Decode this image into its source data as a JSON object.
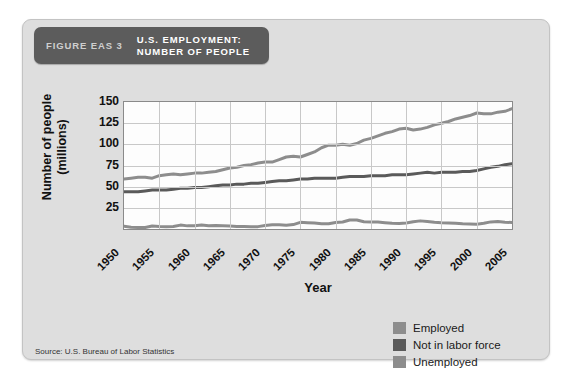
{
  "figure": {
    "label": "FIGURE EAS 3",
    "title": "U.S. EMPLOYMENT:\nNUMBER OF PEOPLE",
    "source": "Source: U.S. Bureau of Labor Statistics"
  },
  "colors": {
    "card_background": "#dedede",
    "banner": "#5c5c5c",
    "plot_background": "#fdfdfd",
    "grid": "#c8c8c8",
    "employed": "#8d8d8d",
    "not_in_labor_force": "#5a5a5a",
    "unemployed": "#8d8d8d"
  },
  "chart_data": {
    "type": "line",
    "title": "U.S. EMPLOYMENT: NUMBER OF PEOPLE",
    "xlabel": "Year",
    "ylabel": "Number of people\n(millions)",
    "xlim": [
      1950,
      2005
    ],
    "ylim": [
      0,
      150
    ],
    "yticks": [
      25,
      50,
      75,
      100,
      125,
      150
    ],
    "xticks": [
      1950,
      1955,
      1960,
      1965,
      1970,
      1975,
      1980,
      1985,
      1990,
      1995,
      2000,
      2005
    ],
    "grid": true,
    "legend_position": "bottom-right",
    "x": [
      1950,
      1951,
      1952,
      1953,
      1954,
      1955,
      1956,
      1957,
      1958,
      1959,
      1960,
      1961,
      1962,
      1963,
      1964,
      1965,
      1966,
      1967,
      1968,
      1969,
      1970,
      1971,
      1972,
      1973,
      1974,
      1975,
      1976,
      1977,
      1978,
      1979,
      1980,
      1981,
      1982,
      1983,
      1984,
      1985,
      1986,
      1987,
      1988,
      1989,
      1990,
      1991,
      1992,
      1993,
      1994,
      1995,
      1996,
      1997,
      1998,
      1999,
      2000,
      2001,
      2002,
      2003,
      2004,
      2005
    ],
    "series": [
      {
        "name": "Employed",
        "values": [
          59,
          60,
          61,
          61,
          60,
          63,
          64,
          65,
          64,
          65,
          66,
          66,
          67,
          68,
          70,
          72,
          73,
          75,
          76,
          78,
          79,
          79,
          82,
          85,
          86,
          85,
          88,
          91,
          96,
          99,
          99,
          100,
          99,
          101,
          105,
          107,
          110,
          113,
          115,
          118,
          119,
          117,
          118,
          120,
          123,
          125,
          127,
          130,
          132,
          134,
          137,
          136,
          136,
          138,
          139,
          142
        ]
      },
      {
        "name": "Not in labor force",
        "values": [
          44,
          44,
          44,
          45,
          46,
          46,
          46,
          47,
          48,
          48,
          49,
          49,
          50,
          51,
          52,
          52,
          53,
          53,
          54,
          54,
          55,
          56,
          57,
          57,
          58,
          59,
          59,
          60,
          60,
          60,
          60,
          61,
          62,
          62,
          62,
          63,
          63,
          63,
          64,
          64,
          64,
          65,
          66,
          67,
          66,
          67,
          67,
          67,
          68,
          68,
          69,
          71,
          73,
          74,
          76,
          77
        ]
      },
      {
        "name": "Unemployed",
        "values": [
          3.3,
          2.1,
          1.9,
          1.8,
          3.5,
          2.9,
          2.8,
          2.9,
          4.6,
          3.7,
          3.9,
          4.7,
          3.9,
          4.1,
          3.8,
          3.4,
          2.9,
          3.0,
          2.8,
          2.8,
          4.1,
          5.0,
          4.9,
          4.4,
          5.2,
          7.9,
          7.4,
          7.0,
          6.2,
          6.1,
          7.6,
          8.3,
          10.7,
          10.7,
          8.5,
          8.3,
          8.2,
          7.4,
          6.7,
          6.5,
          7.0,
          8.6,
          9.6,
          8.9,
          8.0,
          7.4,
          7.2,
          6.7,
          6.2,
          5.9,
          5.7,
          6.8,
          8.4,
          8.8,
          8.1,
          7.6
        ]
      }
    ]
  },
  "legend": [
    {
      "label": "Employed",
      "color": "#8d8d8d"
    },
    {
      "label": "Not in labor force",
      "color": "#5a5a5a"
    },
    {
      "label": "Unemployed",
      "color": "#8d8d8d"
    }
  ]
}
